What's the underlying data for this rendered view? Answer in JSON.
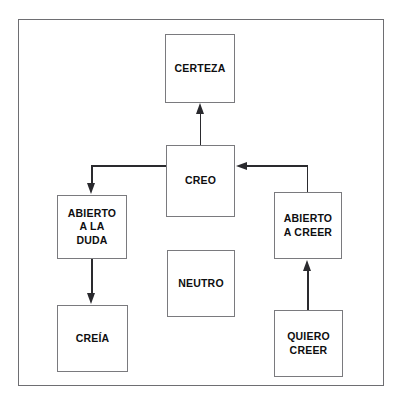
{
  "diagram": {
    "background_color": "#ffffff",
    "frame_color": "#6e6e72",
    "box_border_color": "#7a7a7e",
    "arrow_color": "#2a2a2e",
    "text_color": "#0e0e10",
    "nodes": [
      {
        "id": "certeza",
        "label": "CERTEZA"
      },
      {
        "id": "creo",
        "label": "CREO"
      },
      {
        "id": "abierto-a-la-duda",
        "label": "ABIERTO\nA LA\nDUDA"
      },
      {
        "id": "creia",
        "label": "CREÍA"
      },
      {
        "id": "neutro",
        "label": "NEUTRO"
      },
      {
        "id": "abierto-a-creer",
        "label": "ABIERTO\nA CREER"
      },
      {
        "id": "quiero-creer",
        "label": "QUIERO\nCREER"
      }
    ],
    "edges": [
      {
        "from": "creo",
        "to": "certeza",
        "style": "straight-up"
      },
      {
        "from": "creo",
        "to": "abierto-a-la-duda",
        "style": "elbow-left-down"
      },
      {
        "from": "abierto-a-la-duda",
        "to": "creia",
        "style": "straight-down"
      },
      {
        "from": "abierto-a-creer",
        "to": "creo",
        "style": "elbow-up-left"
      },
      {
        "from": "quiero-creer",
        "to": "abierto-a-creer",
        "style": "straight-up"
      }
    ]
  }
}
